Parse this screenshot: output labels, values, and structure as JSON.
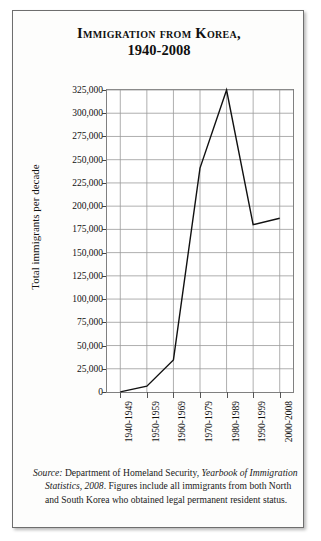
{
  "figure": {
    "title_line1": "Immigration from Korea,",
    "title_line2": "1940-2008"
  },
  "source": {
    "label": "Source:",
    "agency": " Department of Homeland Security, ",
    "publication": "Yearbook of Immigration Statistics, 2008",
    "rest": ". Figures include all immigrants from both North and South Korea who obtained legal permanent resident status."
  },
  "chart_data": {
    "type": "line",
    "title": "Immigration from Korea, 1940-2008",
    "xlabel": "",
    "ylabel": "Total immigrants per decade",
    "categories": [
      "1940-1949",
      "1950-1959",
      "1960-1969",
      "1970-1979",
      "1980-1989",
      "1990-1999",
      "2000-2008"
    ],
    "values": [
      107,
      6231,
      34526,
      241000,
      325000,
      180000,
      187000
    ],
    "ylim": [
      0,
      325000
    ],
    "yticks": [
      0,
      25000,
      50000,
      75000,
      100000,
      125000,
      150000,
      175000,
      200000,
      225000,
      250000,
      275000,
      300000,
      325000
    ],
    "ytick_labels": [
      "0",
      "25,000",
      "50,000",
      "75,000",
      "100,000",
      "125,000",
      "150,000",
      "175,000",
      "200,000",
      "225,000",
      "250,000",
      "275,000",
      "300,000",
      "325,000"
    ],
    "grid": true,
    "legend": false,
    "line_color": "#111111",
    "grid_color": "#9a9a9a"
  }
}
